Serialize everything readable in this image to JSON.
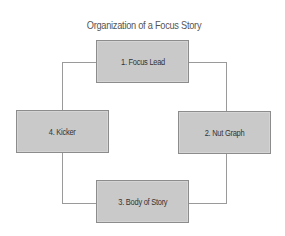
{
  "diagram": {
    "title": "Organization of a Focus Story",
    "nodes": [
      {
        "id": 1,
        "label": "1. Focus Lead",
        "position": "top"
      },
      {
        "id": 2,
        "label": "2. Nut Graph",
        "position": "right"
      },
      {
        "id": 3,
        "label": "3. Body of Story",
        "position": "bottom"
      },
      {
        "id": 4,
        "label": "4. Kicker",
        "position": "left"
      }
    ],
    "edges": [
      {
        "from": 1,
        "to": 2
      },
      {
        "from": 2,
        "to": 3
      },
      {
        "from": 3,
        "to": 4
      },
      {
        "from": 4,
        "to": 1
      }
    ],
    "colors": {
      "box_fill": "#c9c9c9",
      "box_border": "#8c8c8c",
      "connector": "#9a9a9a",
      "text": "#333333",
      "title": "#555555"
    }
  }
}
